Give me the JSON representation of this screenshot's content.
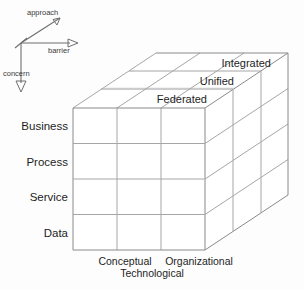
{
  "figure": {
    "background_color": "#fdfdfd",
    "line_color": "#8a8a8a",
    "text_color": "#1d1d1d"
  },
  "axes": {
    "approach": {
      "label": "approach",
      "direction": "up-right-diagonal"
    },
    "barrier": {
      "label": "barrier",
      "direction": "right"
    },
    "concern": {
      "label": "concern",
      "direction": "down"
    }
  },
  "cube": {
    "rows": [
      {
        "label": "Business"
      },
      {
        "label": "Process"
      },
      {
        "label": "Service"
      },
      {
        "label": "Data"
      }
    ],
    "columns": [
      {
        "label": "Conceptual"
      },
      {
        "label": "Technological"
      },
      {
        "label": "Organizational"
      }
    ],
    "layers": [
      {
        "label": "Federated"
      },
      {
        "label": "Unified"
      },
      {
        "label": "Integrated"
      }
    ]
  },
  "icons": {
    "arrow_approach": "arrow-up-right-icon",
    "arrow_barrier": "arrow-right-icon",
    "arrow_concern": "arrow-down-icon"
  }
}
